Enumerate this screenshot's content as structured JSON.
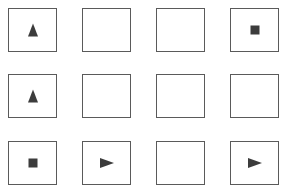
{
  "grid": {
    "rows": 3,
    "cols": 4,
    "cells": [
      {
        "row": 0,
        "col": 0,
        "shape": "triangle-up"
      },
      {
        "row": 0,
        "col": 1,
        "shape": "empty"
      },
      {
        "row": 0,
        "col": 2,
        "shape": "empty"
      },
      {
        "row": 0,
        "col": 3,
        "shape": "square"
      },
      {
        "row": 1,
        "col": 0,
        "shape": "triangle-up"
      },
      {
        "row": 1,
        "col": 1,
        "shape": "empty"
      },
      {
        "row": 1,
        "col": 2,
        "shape": "empty"
      },
      {
        "row": 1,
        "col": 3,
        "shape": "empty"
      },
      {
        "row": 2,
        "col": 0,
        "shape": "square"
      },
      {
        "row": 2,
        "col": 1,
        "shape": "triangle-right"
      },
      {
        "row": 2,
        "col": 2,
        "shape": "empty"
      },
      {
        "row": 2,
        "col": 3,
        "shape": "triangle-right"
      }
    ],
    "colors": {
      "border": "#5a5a5a",
      "shape_fill": "#3c3c3c",
      "background": "#ffffff"
    }
  }
}
